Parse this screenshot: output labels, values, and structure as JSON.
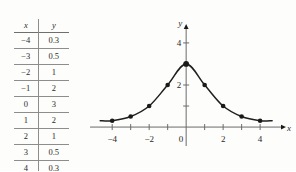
{
  "figure": {
    "caption": ""
  },
  "table": {
    "headers": [
      "x",
      "y"
    ],
    "rows": [
      {
        "x": "−4",
        "y": "0.3"
      },
      {
        "x": "−3",
        "y": "0.5"
      },
      {
        "x": "−2",
        "y": "1"
      },
      {
        "x": "−1",
        "y": "2"
      },
      {
        "x": "0",
        "y": "3"
      },
      {
        "x": "1",
        "y": "2"
      },
      {
        "x": "2",
        "y": "1"
      },
      {
        "x": "3",
        "y": "0.5"
      },
      {
        "x": "4",
        "y": "0.3"
      }
    ]
  },
  "chart_data": {
    "type": "line",
    "title": "",
    "xlabel": "x",
    "ylabel": "y",
    "x": [
      -4,
      -3,
      -2,
      -1,
      0,
      1,
      2,
      3,
      4
    ],
    "values": [
      0.3,
      0.5,
      1,
      2,
      3,
      2,
      1,
      0.5,
      0.3
    ],
    "series": [
      {
        "name": "y",
        "values": [
          0.3,
          0.5,
          1,
          2,
          3,
          2,
          1,
          0.5,
          0.3
        ]
      }
    ],
    "xlim": [
      -5.2,
      5.4
    ],
    "ylim": [
      -0.9,
      4.9
    ],
    "xticks": [
      -4,
      -3,
      -2,
      -1,
      0,
      1,
      2,
      3,
      4
    ],
    "xtick_labels": [
      "−4",
      "",
      "−2",
      "",
      "0",
      "",
      "2",
      "",
      "4"
    ],
    "yticks": [
      2,
      4
    ],
    "ytick_labels": [
      "2",
      "4"
    ],
    "grid": false,
    "legend": "none",
    "markers": true,
    "marker_color": "#1a1a1a",
    "line_color": "#1f1f1f",
    "axis_color": "#6b6b6b"
  }
}
